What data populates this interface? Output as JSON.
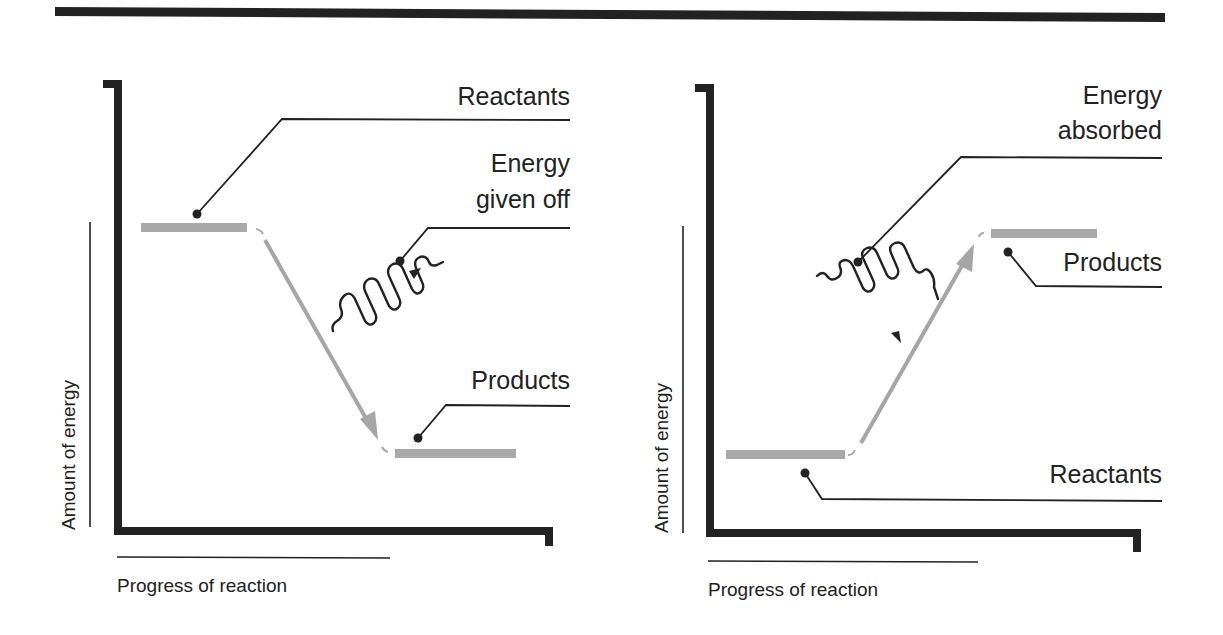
{
  "colors": {
    "ink": "#222222",
    "level_bar": "#a9a9a9",
    "transition_arrow": "#a6a6a6",
    "background": "#ffffff"
  },
  "panels": [
    {
      "name": "exothermic",
      "y_axis_label": "Amount of energy",
      "x_axis_label": "Progress of reaction",
      "labels": {
        "reactants": "Reactants",
        "energy_line1": "Energy",
        "energy_line2": "given off",
        "products": "Products"
      },
      "energy_icon": "wavy-arrow-outward-icon"
    },
    {
      "name": "endothermic",
      "y_axis_label": "Amount of energy",
      "x_axis_label": "Progress of reaction",
      "labels": {
        "energy_line1": "Energy",
        "energy_line2": "absorbed",
        "products": "Products",
        "reactants": "Reactants"
      },
      "energy_icon": "wavy-arrow-inward-icon"
    }
  ]
}
